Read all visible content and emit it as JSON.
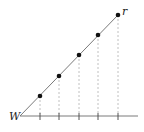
{
  "diagram": {
    "labels": {
      "origin": "W",
      "end": "r"
    },
    "colors": {
      "line": "#7a7a7a",
      "point": "#111111",
      "dashed": "#b0b0b0",
      "axis": "#7a7a7a"
    },
    "origin": {
      "x": 20,
      "y": 116
    },
    "end": {
      "x": 118,
      "y": 15
    },
    "axis": {
      "x1": 20,
      "x2": 138,
      "y": 116
    },
    "points": [
      {
        "x": 40,
        "y": 96
      },
      {
        "x": 59,
        "y": 76
      },
      {
        "x": 79,
        "y": 55
      },
      {
        "x": 98,
        "y": 35
      },
      {
        "x": 118,
        "y": 15
      }
    ]
  }
}
